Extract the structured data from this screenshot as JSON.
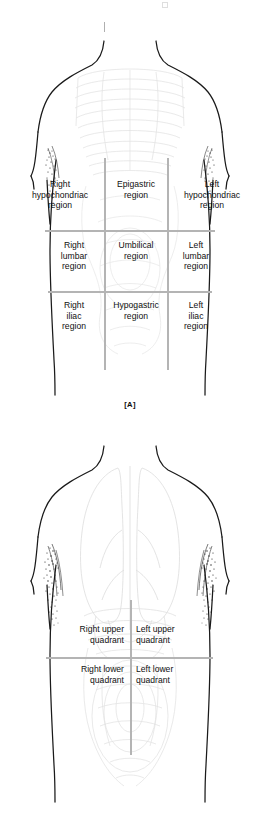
{
  "figure": {
    "panels": [
      {
        "id": "A",
        "caption": "[A]",
        "scheme": "nine-regions",
        "view": "anterior torso outline with faint underlying viscera",
        "grid": {
          "type": "3x3",
          "line_color": "#b4b4b4",
          "vertical_lines_x": [
            104,
            167
          ],
          "horizontal_lines_y": [
            230,
            291
          ]
        },
        "regions": [
          {
            "key": "right-hypochondriac",
            "label": "Right\nhypochondriac\nregion",
            "row": "upper",
            "column": "right"
          },
          {
            "key": "epigastric",
            "label": "Epigastric\nregion",
            "row": "upper",
            "column": "middle"
          },
          {
            "key": "left-hypochondriac",
            "label": "Left\nhypochondriac\nregion",
            "row": "upper",
            "column": "left"
          },
          {
            "key": "right-lumbar",
            "label": "Right\nlumbar\nregion",
            "row": "middle",
            "column": "right"
          },
          {
            "key": "umbilical",
            "label": "Umbilical\nregion",
            "row": "middle",
            "column": "middle"
          },
          {
            "key": "left-lumbar",
            "label": "Left\nlumbar\nregion",
            "row": "middle",
            "column": "left"
          },
          {
            "key": "right-iliac",
            "label": "Right\niliac\nregion",
            "row": "lower",
            "column": "right"
          },
          {
            "key": "hypogastric",
            "label": "Hypogastric\nregion",
            "row": "lower",
            "column": "middle"
          },
          {
            "key": "left-iliac",
            "label": "Left\niliac\nregion",
            "row": "lower",
            "column": "left"
          }
        ]
      },
      {
        "id": "B",
        "caption": "[B]",
        "scheme": "four-quadrants",
        "view": "anterior torso outline with faint lungs, ribcage and intestines",
        "grid": {
          "type": "2x2",
          "line_color": "#b4b4b4",
          "vertical_lines_x": [
            130
          ],
          "horizontal_lines_y": [
            657
          ]
        },
        "quadrants": [
          {
            "key": "right-upper-quadrant",
            "label": "Right upper\nquadrant",
            "row": "upper",
            "column": "right"
          },
          {
            "key": "left-upper-quadrant",
            "label": "Left upper\nquadrant",
            "row": "upper",
            "column": "left"
          },
          {
            "key": "right-lower-quadrant",
            "label": "Right lower\nquadrant",
            "row": "lower",
            "column": "right"
          },
          {
            "key": "left-lower-quadrant",
            "label": "Left lower\nquadrant",
            "row": "lower",
            "column": "left"
          }
        ]
      }
    ],
    "colors": {
      "outline": "#1a1a1a",
      "gridline": "#b4b4b4",
      "viscera_faint": "#d9d9d9",
      "text": "#101010",
      "background": "#ffffff"
    }
  }
}
